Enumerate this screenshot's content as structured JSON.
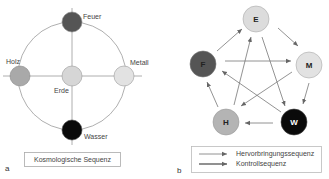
{
  "panel_a": {
    "letter": "a",
    "caption": "Kosmologische Sequenz",
    "nodes": [
      {
        "id": "feuer",
        "label": "Feuer",
        "color": "#555555"
      },
      {
        "id": "holz",
        "label": "Holz",
        "color": "#a9a9a9"
      },
      {
        "id": "erde",
        "label": "Erde",
        "color": "#d6d6d6"
      },
      {
        "id": "metall",
        "label": "Metall",
        "color": "#e2e2e2"
      },
      {
        "id": "wasser",
        "label": "Wasser",
        "color": "#0a0a0a"
      }
    ]
  },
  "panel_b": {
    "letter": "b",
    "nodes": [
      {
        "id": "E",
        "label": "E",
        "color": "#dcdcdc"
      },
      {
        "id": "M",
        "label": "M",
        "color": "#e2e2e2"
      },
      {
        "id": "W",
        "label": "W",
        "color": "#0a0a0a"
      },
      {
        "id": "H",
        "label": "H",
        "color": "#b4b4b4"
      },
      {
        "id": "F",
        "label": "F",
        "color": "#555555"
      }
    ],
    "generating_sequence": [
      [
        "F",
        "E"
      ],
      [
        "E",
        "M"
      ],
      [
        "M",
        "W"
      ],
      [
        "W",
        "H"
      ],
      [
        "H",
        "F"
      ]
    ],
    "control_sequence": [
      [
        "F",
        "M"
      ],
      [
        "M",
        "H"
      ],
      [
        "H",
        "E"
      ],
      [
        "E",
        "W"
      ],
      [
        "W",
        "F"
      ]
    ],
    "legend": [
      {
        "label": "Hervorbringungssequenz"
      },
      {
        "label": "Kontrollsequenz"
      }
    ]
  }
}
